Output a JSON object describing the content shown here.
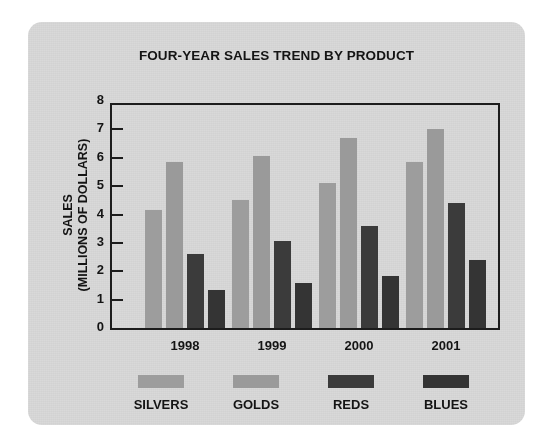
{
  "card": {
    "background_color": "#d9d9d9"
  },
  "chart_data": {
    "type": "bar",
    "title": "FOUR-YEAR SALES TREND BY PRODUCT",
    "xlabel": "",
    "ylabel": "SALES (MILLIONS OF DOLLARS)",
    "ylabel_line1": "SALES",
    "ylabel_line2": "(MILLIONS OF DOLLARS)",
    "categories": [
      "1998",
      "1999",
      "2000",
      "2001"
    ],
    "ylim": [
      0,
      8
    ],
    "yticks": [
      "0",
      "1",
      "2",
      "3",
      "4",
      "5",
      "6",
      "7",
      "8"
    ],
    "ytick_values": [
      0,
      1,
      2,
      3,
      4,
      5,
      6,
      7,
      8
    ],
    "grid": false,
    "legend_position": "bottom",
    "series": [
      {
        "name": "SILVERS",
        "color": "#9d9d9d",
        "values": [
          4.15,
          4.5,
          5.1,
          5.85
        ]
      },
      {
        "name": "GOLDS",
        "color": "#9a9a9a",
        "values": [
          5.85,
          6.05,
          6.7,
          7.0
        ]
      },
      {
        "name": "REDS",
        "color": "#3b3b3b",
        "values": [
          2.6,
          3.05,
          3.6,
          4.4
        ]
      },
      {
        "name": "BLUES",
        "color": "#343434",
        "values": [
          1.35,
          1.6,
          1.85,
          2.4
        ]
      }
    ]
  }
}
